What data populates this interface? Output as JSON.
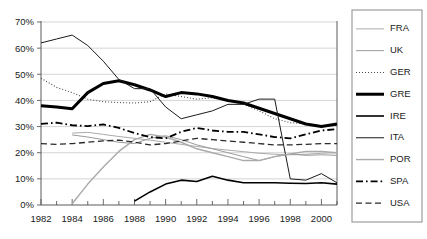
{
  "chart_data": {
    "type": "line",
    "title": "",
    "subtitle": "",
    "xlabel": "",
    "ylabel": "",
    "xlim": [
      1982,
      2001
    ],
    "ylim": [
      0,
      70
    ],
    "ytick_labels": [
      "0%",
      "10%",
      "20%",
      "30%",
      "40%",
      "50%",
      "60%",
      "70%"
    ],
    "ytick_values": [
      0,
      10,
      20,
      30,
      40,
      50,
      60,
      70
    ],
    "xtick_labels": [
      "1982",
      "1984",
      "1986",
      "1988",
      "1990",
      "1992",
      "1994",
      "1996",
      "1998",
      "2000"
    ],
    "xtick_values": [
      1982,
      1984,
      1986,
      1988,
      1990,
      1992,
      1994,
      1996,
      1998,
      2000
    ],
    "x_minor_ticks": [
      1982,
      1983,
      1984,
      1985,
      1986,
      1987,
      1988,
      1989,
      1990,
      1991,
      1992,
      1993,
      1994,
      1995,
      1996,
      1997,
      1998,
      1999,
      2000,
      2001
    ],
    "grid": "horizontal",
    "legend_position": "right",
    "x": [
      1982,
      1983,
      1984,
      1985,
      1986,
      1987,
      1988,
      1989,
      1990,
      1991,
      1992,
      1993,
      1994,
      1995,
      1996,
      1997,
      1998,
      1999,
      2000,
      2001
    ],
    "series": [
      {
        "name": "FRA",
        "style": "solid",
        "color": "#aaaaaa",
        "width": 1.0,
        "values": [
          null,
          null,
          27.5,
          27.8,
          27.0,
          26.2,
          25.5,
          24.8,
          24.0,
          23.2,
          22.4,
          21.6,
          21.0,
          20.4,
          19.8,
          19.4,
          19.2,
          19.4,
          19.8,
          20.0
        ]
      },
      {
        "name": "UK",
        "style": "solid",
        "color": "#9a9a9a",
        "width": 1.0,
        "values": [
          null,
          null,
          26.8,
          26.0,
          25.0,
          24.0,
          23.5,
          25.5,
          26.5,
          25.0,
          23.0,
          21.5,
          20.0,
          18.5,
          17.0,
          18.5,
          19.5,
          19.0,
          19.2,
          19.0
        ]
      },
      {
        "name": "GER",
        "style": "dotted",
        "color": "#4a4a4a",
        "width": 1.1,
        "values": [
          48.5,
          45.0,
          43.0,
          40.5,
          39.5,
          39.2,
          39.0,
          39.5,
          42.5,
          41.5,
          40.5,
          41.0,
          40.0,
          38.5,
          36.0,
          33.0,
          31.5,
          31.0,
          30.0,
          30.5
        ]
      },
      {
        "name": "GRE",
        "style": "solid",
        "color": "#000000",
        "width": 3.0,
        "values": [
          38.0,
          37.5,
          36.8,
          43.0,
          46.5,
          47.5,
          46.0,
          44.0,
          41.5,
          43.0,
          42.5,
          41.5,
          40.0,
          39.0,
          37.0,
          35.0,
          33.0,
          31.0,
          30.0,
          31.0
        ]
      },
      {
        "name": "IRE",
        "style": "solid",
        "color": "#000000",
        "width": 1.6,
        "values": [
          null,
          null,
          null,
          null,
          null,
          null,
          1.5,
          5.0,
          8.0,
          9.5,
          9.0,
          11.0,
          9.5,
          8.5,
          8.5,
          8.5,
          8.3,
          8.2,
          8.5,
          8.0
        ]
      },
      {
        "name": "ITA",
        "style": "solid",
        "color": "#1a1a1a",
        "width": 1.0,
        "values": [
          62.0,
          63.5,
          65.0,
          61.0,
          55.0,
          48.0,
          44.5,
          44.5,
          37.5,
          33.0,
          34.5,
          36.0,
          38.5,
          38.5,
          40.5,
          40.5,
          10.0,
          9.5,
          12.0,
          8.5
        ]
      },
      {
        "name": "POR",
        "style": "solid",
        "color": "#aaaaaa",
        "width": 1.4,
        "values": [
          null,
          null,
          0.5,
          8.0,
          14.5,
          20.5,
          25.0,
          27.0,
          26.0,
          24.0,
          21.5,
          20.0,
          18.5,
          17.0,
          17.0,
          18.5,
          19.5,
          20.5,
          20.5,
          20.0
        ]
      },
      {
        "name": "SPA",
        "style": "dashdot",
        "color": "#000000",
        "width": 1.8,
        "values": [
          31.0,
          31.5,
          30.5,
          30.2,
          30.8,
          29.5,
          27.5,
          26.0,
          25.5,
          28.0,
          29.5,
          28.5,
          28.0,
          28.0,
          27.0,
          26.0,
          25.5,
          27.0,
          28.5,
          29.0
        ]
      },
      {
        "name": "USA",
        "style": "dashed",
        "color": "#2a2a2a",
        "width": 1.3,
        "values": [
          23.5,
          23.2,
          23.5,
          24.0,
          24.5,
          24.8,
          24.0,
          23.0,
          23.5,
          24.5,
          25.5,
          25.0,
          24.5,
          24.0,
          23.5,
          23.0,
          23.0,
          23.2,
          23.5,
          23.5
        ]
      }
    ]
  },
  "legend": {
    "entries": [
      {
        "label": "FRA"
      },
      {
        "label": "UK"
      },
      {
        "label": "GER"
      },
      {
        "label": "GRE"
      },
      {
        "label": "IRE"
      },
      {
        "label": "ITA"
      },
      {
        "label": "POR"
      },
      {
        "label": "SPA"
      },
      {
        "label": "USA"
      }
    ]
  },
  "colors": {
    "background": "#ffffff",
    "grid": "#c9c9c9",
    "axis": "#5a5a5a",
    "text": "#1a1a1a",
    "legend_border": "#8a8a8a"
  }
}
